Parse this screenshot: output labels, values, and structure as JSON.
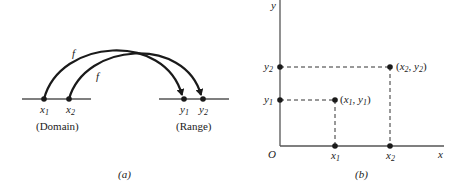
{
  "panel_a": {
    "caption": "(a)",
    "domain_label": "(Domain)",
    "range_label": "(Range)",
    "function_label": "f",
    "domain_points": [
      {
        "name": "x",
        "sub": "1"
      },
      {
        "name": "x",
        "sub": "2"
      }
    ],
    "range_points": [
      {
        "name": "y",
        "sub": "1"
      },
      {
        "name": "y",
        "sub": "2"
      }
    ]
  },
  "panel_b": {
    "caption": "(b)",
    "origin_label": "O",
    "x_axis_label": "x",
    "y_axis_label": "y",
    "x_ticks": [
      {
        "name": "x",
        "sub": "1"
      },
      {
        "name": "x",
        "sub": "2"
      }
    ],
    "y_ticks": [
      {
        "name": "y",
        "sub": "1"
      },
      {
        "name": "y",
        "sub": "2"
      }
    ],
    "points": [
      {
        "label": "(x1, y1)",
        "x": "x",
        "xsub": "1",
        "y": "y",
        "ysub": "1"
      },
      {
        "label": "(x2, y2)",
        "x": "x",
        "xsub": "2",
        "y": "y",
        "ysub": "2"
      }
    ]
  },
  "colors": {
    "ink": "#1a1a1a",
    "axis": "#555555"
  }
}
